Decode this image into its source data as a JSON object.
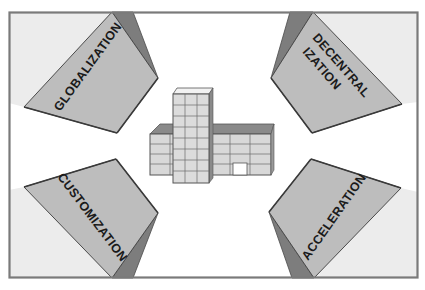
{
  "diagram": {
    "colors": {
      "background": "#ffffff",
      "frame": "#7a7a7a",
      "corner_fill": "#ececec",
      "face_fill": "#bdbdbd",
      "side_fill": "#7d7d7d",
      "edge": "#4a4a4a",
      "building_fill": "#d8d8d8",
      "building_roof": "#8a8a8a",
      "building_grid": "#6a6a6a",
      "text": "#1a1a1a"
    },
    "center": {
      "icon": "office-building-icon"
    },
    "panels": [
      {
        "id": "top-left",
        "label_lines": [
          "GLOBALIZATION"
        ]
      },
      {
        "id": "top-right",
        "label_lines": [
          "DECENTRAL",
          "IZATION"
        ]
      },
      {
        "id": "bottom-left",
        "label_lines": [
          "CUSTOMIZATION"
        ]
      },
      {
        "id": "bottom-right",
        "label_lines": [
          "ACCELERATION"
        ]
      }
    ]
  }
}
